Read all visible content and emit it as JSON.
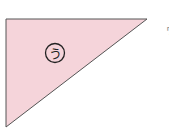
{
  "diagram": {
    "shape": "right-triangle",
    "fill_color": "#f5d4da",
    "stroke_color": "#555555",
    "label": "う",
    "label_circled": true,
    "edge_glyph": "ヮ"
  }
}
